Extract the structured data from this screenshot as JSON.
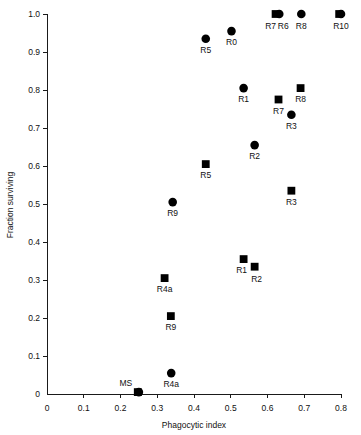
{
  "chart_data": {
    "type": "scatter",
    "title": "",
    "xlabel": "Phagocytic index",
    "ylabel": "Fraction surviving",
    "xlim": [
      0,
      0.8
    ],
    "ylim": [
      0,
      1.0
    ],
    "xticks": [
      "0",
      "0.1",
      "0.2",
      "0.3",
      "0.4",
      "0.5",
      "0.6",
      "0.7",
      "0.8"
    ],
    "xtick_values": [
      0,
      0.1,
      0.2,
      0.3,
      0.4,
      0.5,
      0.6,
      0.7,
      0.8
    ],
    "yticks": [
      "0",
      "0.1",
      "0.2",
      "0.3",
      "0.4",
      "0.5",
      "0.6",
      "0.7",
      "0.8",
      "0.9",
      "1.0"
    ],
    "ytick_values": [
      0,
      0.1,
      0.2,
      0.3,
      0.4,
      0.5,
      0.6,
      0.7,
      0.8,
      0.9,
      1.0
    ],
    "grid": false,
    "legend": null,
    "marker_color": "#000000",
    "series": [
      {
        "name": "circle",
        "marker": "circle",
        "points": [
          {
            "label": "MS",
            "x": 0.25,
            "y": 0.005,
            "label_dx": -13,
            "label_dy": -6
          },
          {
            "label": "R4a",
            "x": 0.338,
            "y": 0.055,
            "label_dx": 0,
            "label_dy": 14
          },
          {
            "label": "R9",
            "x": 0.342,
            "y": 0.505,
            "label_dx": 0,
            "label_dy": 14
          },
          {
            "label": "R2",
            "x": 0.565,
            "y": 0.655,
            "label_dx": 0,
            "label_dy": 14
          },
          {
            "label": "R3",
            "x": 0.665,
            "y": 0.735,
            "label_dx": 0,
            "label_dy": 14
          },
          {
            "label": "R1",
            "x": 0.535,
            "y": 0.805,
            "label_dx": 0,
            "label_dy": 14
          },
          {
            "label": "R5",
            "x": 0.432,
            "y": 0.935,
            "label_dx": 0,
            "label_dy": 14
          },
          {
            "label": "R0",
            "x": 0.502,
            "y": 0.955,
            "label_dx": 0,
            "label_dy": 14
          },
          {
            "label": "R6",
            "x": 0.632,
            "y": 1.0,
            "label_dx": 4,
            "label_dy": 15
          },
          {
            "label": "R8",
            "x": 0.692,
            "y": 1.0,
            "label_dx": 0,
            "label_dy": 15
          },
          {
            "label": "R10",
            "x": 0.8,
            "y": 1.0,
            "label_dx": 0,
            "label_dy": 15
          }
        ]
      },
      {
        "name": "square",
        "marker": "square",
        "points": [
          {
            "label": "MS",
            "x": 0.247,
            "y": 0.005,
            "label_dx": 0,
            "label_dy": 0,
            "hide_label": true
          },
          {
            "label": "R9",
            "x": 0.337,
            "y": 0.205,
            "label_dx": 0,
            "label_dy": 14
          },
          {
            "label": "R4a",
            "x": 0.32,
            "y": 0.305,
            "label_dx": 0,
            "label_dy": 14
          },
          {
            "label": "R2",
            "x": 0.565,
            "y": 0.335,
            "label_dx": 2,
            "label_dy": 15
          },
          {
            "label": "R1",
            "x": 0.535,
            "y": 0.355,
            "label_dx": -2,
            "label_dy": 14
          },
          {
            "label": "R3",
            "x": 0.665,
            "y": 0.535,
            "label_dx": 0,
            "label_dy": 14
          },
          {
            "label": "R5",
            "x": 0.432,
            "y": 0.605,
            "label_dx": 0,
            "label_dy": 14
          },
          {
            "label": "R7",
            "x": 0.63,
            "y": 0.775,
            "label_dx": 0,
            "label_dy": 14
          },
          {
            "label": "R8",
            "x": 0.69,
            "y": 0.805,
            "label_dx": 0,
            "label_dy": 14
          },
          {
            "label": "R7",
            "x": 0.622,
            "y": 1.0,
            "label_dx": -5,
            "label_dy": 15
          },
          {
            "label": "R10",
            "x": 0.795,
            "y": 1.0,
            "label_dx": 0,
            "label_dy": 0,
            "hide_label": true
          }
        ]
      }
    ]
  },
  "figure": {
    "background": "#ffffff",
    "axis_color": "#1a1a1a"
  }
}
